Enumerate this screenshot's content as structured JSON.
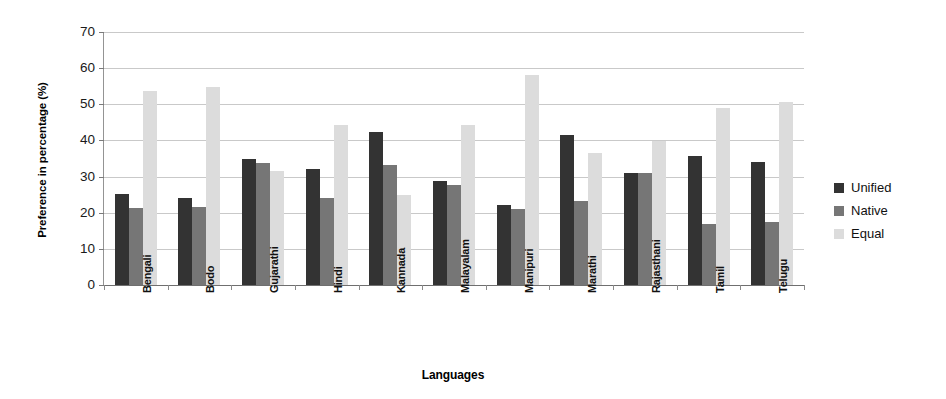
{
  "chart_data": {
    "type": "bar",
    "title": "",
    "xlabel": "Languages",
    "ylabel": "Preference in percentage (%)",
    "ylim": [
      0,
      70
    ],
    "ytick_step": 10,
    "yticks": [
      0,
      10,
      20,
      30,
      40,
      50,
      60,
      70
    ],
    "grid": true,
    "legend_position": "right",
    "categories": [
      "Bengali",
      "Bodo",
      "Gujarathi",
      "Hindi",
      "Kannada",
      "Malayalam",
      "Manipuri",
      "Marathi",
      "Rajasthani",
      "Tamil",
      "Telugu"
    ],
    "series": [
      {
        "name": "Unified",
        "color": "#333333",
        "values": [
          25.2,
          24.1,
          34.8,
          32.2,
          42.4,
          28.8,
          22.1,
          41.6,
          31.0,
          35.8,
          33.9
        ]
      },
      {
        "name": "Native",
        "color": "#767676",
        "values": [
          21.2,
          21.6,
          33.7,
          24.2,
          33.1,
          27.8,
          21.0,
          23.3,
          30.9,
          17.0,
          17.5
        ]
      },
      {
        "name": "Equal",
        "color": "#dcdcdc",
        "values": [
          53.6,
          54.7,
          31.6,
          44.4,
          24.8,
          44.3,
          58.2,
          36.6,
          39.8,
          48.9,
          50.7
        ]
      }
    ]
  },
  "legend": {
    "items": [
      {
        "label": "Unified",
        "color": "#333333"
      },
      {
        "label": "Native",
        "color": "#767676"
      },
      {
        "label": "Equal",
        "color": "#dcdcdc"
      }
    ]
  }
}
